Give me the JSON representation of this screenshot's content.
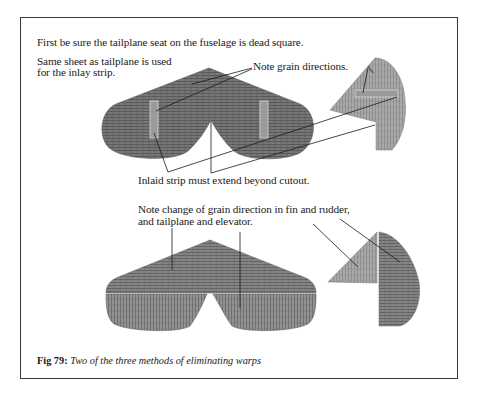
{
  "figure": {
    "intro": "First be sure the tailplane seat on the fuselage is dead square.",
    "method1": {
      "note_sheet_line1": "Same sheet as tailplane is used",
      "note_sheet_line2": "for the inlay strip.",
      "note_grain": "Note grain directions.",
      "note_inlaid": "Inlaid strip must extend beyond cutout."
    },
    "method2": {
      "note_line1": "Note change of grain direction in fin and rudder,",
      "note_line2": "and tailplane and elevator."
    },
    "caption_label": "Fig 79:",
    "caption_text": "Two of the three methods of eliminating warps"
  },
  "colors": {
    "wood_dark": "#6b6b6b",
    "wood_mid": "#8a8a8a",
    "wood_light": "#a6a6a6",
    "strip": "#c8c8c8",
    "line": "#1a1a1a",
    "frame": "#3a3a3a"
  }
}
